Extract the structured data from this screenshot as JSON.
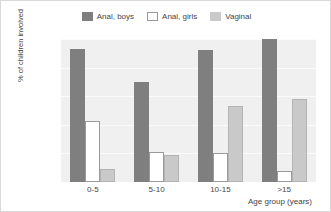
{
  "chart_data": {
    "type": "bar",
    "title": "",
    "xlabel": "Age group (years)",
    "ylabel": "% of children involved",
    "categories": [
      "0-5",
      "5-10",
      "10-15",
      ">15"
    ],
    "series": [
      {
        "name": "Anal, boys",
        "color": "#7f7f7f",
        "values": [
          93,
          70,
          92,
          100
        ]
      },
      {
        "name": "Anal, girls",
        "color": "#ffffff",
        "values": [
          43,
          21,
          20,
          8
        ]
      },
      {
        "name": "Vaginal",
        "color": "#c9c9c9",
        "values": [
          9,
          19,
          53,
          58
        ]
      }
    ],
    "ylim": [
      0,
      100
    ],
    "yticks": [
      0,
      20,
      40,
      60,
      80,
      100
    ],
    "ytick_labels": [
      "0",
      "20",
      "40",
      "60",
      "80",
      "100"
    ],
    "grid": true,
    "legend_position": "top-center",
    "plot_background": "#f0f0f0",
    "gridline_color": "#fbfbfb"
  }
}
